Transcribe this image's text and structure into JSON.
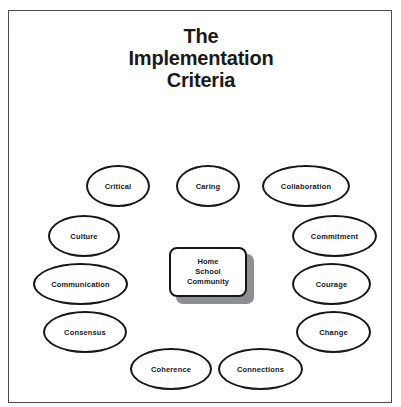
{
  "slide": {
    "title_lines": [
      "The",
      "Implementation",
      "Criteria"
    ],
    "border_color": "#4a4a52",
    "background_color": "#ffffff"
  },
  "center": {
    "lines": [
      "Home",
      "School",
      "Community"
    ],
    "shadow_color": "#8d8d94",
    "outline_color": "#17171a"
  },
  "nodes": [
    {
      "label": "Critical",
      "x": 85,
      "y": 164,
      "w": 64,
      "h": 42
    },
    {
      "label": "Caring",
      "x": 175,
      "y": 164,
      "w": 64,
      "h": 42
    },
    {
      "label": "Collaboration",
      "x": 261,
      "y": 164,
      "w": 88,
      "h": 42
    },
    {
      "label": "Culture",
      "x": 47,
      "y": 214,
      "w": 72,
      "h": 42
    },
    {
      "label": "Commitment",
      "x": 291,
      "y": 214,
      "w": 85,
      "h": 42
    },
    {
      "label": "Communication",
      "x": 32,
      "y": 262,
      "w": 95,
      "h": 42
    },
    {
      "label": "Courage",
      "x": 291,
      "y": 262,
      "w": 79,
      "h": 42
    },
    {
      "label": "Consensus",
      "x": 42,
      "y": 310,
      "w": 84,
      "h": 42
    },
    {
      "label": "Change",
      "x": 295,
      "y": 310,
      "w": 75,
      "h": 42
    },
    {
      "label": "Coherence",
      "x": 129,
      "y": 347,
      "w": 82,
      "h": 42
    },
    {
      "label": "Connections",
      "x": 217,
      "y": 347,
      "w": 85,
      "h": 42
    }
  ]
}
